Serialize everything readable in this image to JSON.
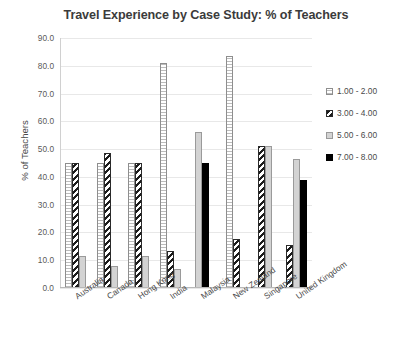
{
  "chart_data": {
    "type": "bar",
    "title": "Travel Experience by Case Study: %  of Teachers",
    "xlabel": "",
    "ylabel": "% of Teachers",
    "ylim": [
      0,
      90
    ],
    "ytick_step": 10,
    "grid": true,
    "legend_position": "right",
    "categories": [
      "Australia",
      "Canada",
      "Hong Kong",
      "India",
      "Malaysia",
      "New Zealand",
      "Singapore",
      "United Kingdom"
    ],
    "ytick_labels": [
      "0.0",
      "10.0",
      "20.0",
      "30.0",
      "40.0",
      "50.0",
      "60.0",
      "70.0",
      "80.0",
      "90.0"
    ],
    "series": [
      {
        "name": "1.00 - 2.00",
        "color": "#ffffff",
        "pattern": "dotted-vertical",
        "values": [
          45.0,
          45.0,
          45.0,
          81.0,
          0,
          83.5,
          0,
          0
        ]
      },
      {
        "name": "3.00 - 4.00",
        "color": "#1c1c1c",
        "pattern": "diagonal-hatch",
        "values": [
          45.0,
          48.5,
          45.0,
          13.5,
          0,
          17.5,
          51.0,
          15.5
        ]
      },
      {
        "name": "5.00 - 6.00",
        "color": "#d3d3d3",
        "pattern": "solid-light",
        "values": [
          11.5,
          8.0,
          11.5,
          7.0,
          56.0,
          0,
          51.0,
          46.5
        ]
      },
      {
        "name": "7.00 - 8.00",
        "color": "#000000",
        "pattern": "solid-black",
        "values": [
          0,
          0,
          0,
          0,
          45.0,
          0,
          0,
          39.0
        ]
      }
    ]
  },
  "legend": {
    "items": [
      {
        "label": "1.00 - 2.00"
      },
      {
        "label": "3.00 - 4.00"
      },
      {
        "label": "5.00 - 6.00"
      },
      {
        "label": "7.00 - 8.00"
      }
    ]
  }
}
